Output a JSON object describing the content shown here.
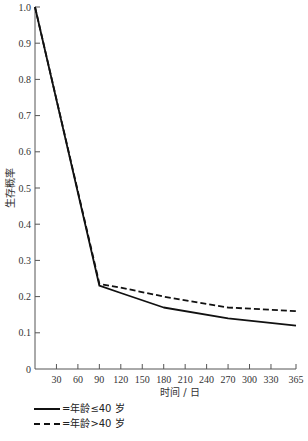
{
  "chart_data": {
    "type": "line",
    "title": "",
    "xlabel": "时间 / 日",
    "ylabel": "生存概率",
    "x_ticks": [
      30,
      60,
      90,
      120,
      150,
      180,
      210,
      240,
      270,
      300,
      330,
      365
    ],
    "y_ticks": [
      0,
      0.1,
      0.2,
      0.3,
      0.4,
      0.5,
      0.6,
      0.7,
      0.8,
      0.9,
      1.0
    ],
    "y_tick_labels": [
      "0",
      "0.1",
      "0.2",
      "0.3",
      "0.4",
      "0.5",
      "0.6",
      "0.7",
      "0.8",
      "0.9",
      "1.0"
    ],
    "xlim": [
      0,
      365
    ],
    "ylim": [
      0,
      1.0
    ],
    "grid": false,
    "legend_position": "bottom-left",
    "series": [
      {
        "name": "=年龄≤40 岁",
        "style": "solid",
        "x": [
          0,
          90,
          120,
          180,
          270,
          365
        ],
        "values": [
          1.0,
          0.23,
          0.21,
          0.17,
          0.14,
          0.12
        ]
      },
      {
        "name": "=年龄>40 岁",
        "style": "dashed",
        "x": [
          0,
          90,
          120,
          180,
          270,
          365
        ],
        "values": [
          1.0,
          0.235,
          0.225,
          0.2,
          0.17,
          0.16
        ]
      }
    ]
  },
  "legend": {
    "items": [
      {
        "label": "=年龄≤40 岁",
        "style": "solid"
      },
      {
        "label": "=年龄>40 岁",
        "style": "dashed"
      }
    ]
  },
  "colors": {
    "line": "#111111",
    "axis": "#555555"
  }
}
